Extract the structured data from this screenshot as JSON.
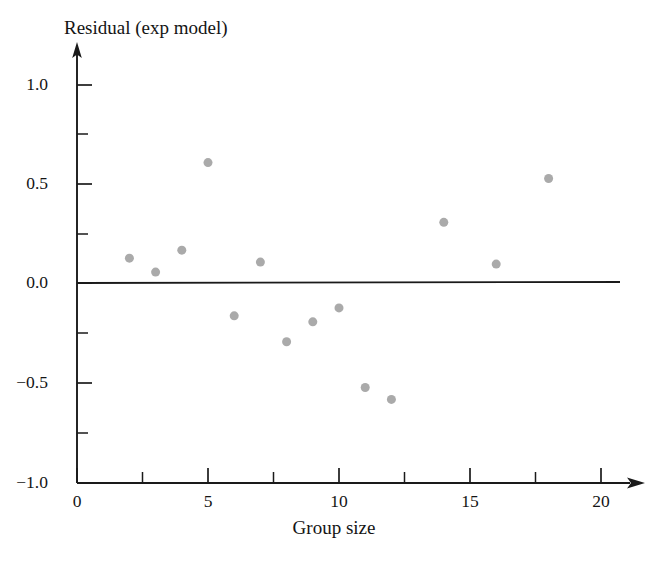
{
  "chart_data": {
    "type": "scatter",
    "title": "",
    "xlabel": "Group size",
    "ylabel": "Residual (exp model)",
    "xlim": [
      0,
      20
    ],
    "ylim": [
      -1.0,
      1.0
    ],
    "grid": false,
    "legend": null,
    "xticks": [
      0,
      5,
      10,
      15,
      20
    ],
    "xtick_labels": [
      "0",
      "5",
      "10",
      "15",
      "20"
    ],
    "xminor_ticks": [
      2.5,
      7.5,
      12.5,
      17.5
    ],
    "yticks": [
      -1.0,
      -0.5,
      0.0,
      0.5,
      1.0
    ],
    "ytick_labels": [
      "-1.0",
      "-0.5",
      "0.0",
      "0.5",
      "1.0"
    ],
    "yminor_ticks": [
      -0.75,
      -0.25,
      0.25,
      0.75
    ],
    "reference_line": {
      "orientation": "horizontal",
      "y": 0.0,
      "color": "#1a1a1a"
    },
    "marker": {
      "shape": "circle",
      "color": "#aaaaaa",
      "size_px": 9
    },
    "x": [
      2,
      3,
      4,
      5,
      6,
      7,
      8,
      9,
      10,
      11,
      12,
      14,
      16,
      18
    ],
    "y": [
      0.13,
      0.06,
      0.17,
      0.61,
      -0.16,
      0.11,
      -0.29,
      -0.19,
      -0.12,
      -0.52,
      -0.58,
      0.31,
      0.1,
      0.53
    ],
    "points": [
      {
        "x": 2,
        "y": 0.13
      },
      {
        "x": 3,
        "y": 0.06
      },
      {
        "x": 4,
        "y": 0.17
      },
      {
        "x": 5,
        "y": 0.61
      },
      {
        "x": 6,
        "y": -0.16
      },
      {
        "x": 7,
        "y": 0.11
      },
      {
        "x": 8,
        "y": -0.29
      },
      {
        "x": 9,
        "y": -0.19
      },
      {
        "x": 10,
        "y": -0.12
      },
      {
        "x": 11,
        "y": -0.52
      },
      {
        "x": 12,
        "y": -0.58
      },
      {
        "x": 14,
        "y": 0.31
      },
      {
        "x": 16,
        "y": 0.1
      },
      {
        "x": 18,
        "y": 0.53
      }
    ]
  },
  "labels": {
    "y_axis_title": "Residual (exp model)",
    "x_axis_title": "Group size",
    "y_1_0": "1.0",
    "y_0_5": "0.5",
    "y_0_0": "0.0",
    "y_neg_0_5": "−0.5",
    "y_neg_1_0": "−1.0",
    "x_0": "0",
    "x_5": "5",
    "x_10": "10",
    "x_15": "15",
    "x_20": "20"
  },
  "colors": {
    "axis": "#1a1a1a",
    "marker": "#aaaaaa",
    "background": "#ffffff"
  }
}
